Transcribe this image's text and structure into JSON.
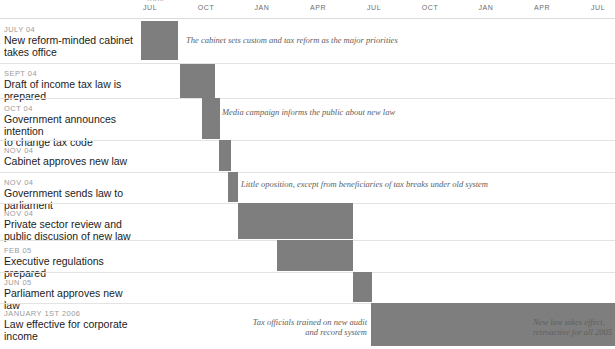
{
  "chart_data": {
    "type": "bar",
    "xlabel": "",
    "ylabel": "",
    "grid": false,
    "legend": null,
    "axis": {
      "position": "top",
      "partial_year_label": "2004",
      "ticks": [
        {
          "label": "JUL",
          "x": 150
        },
        {
          "label": "OCT",
          "x": 206
        },
        {
          "label": "JAN",
          "x": 262
        },
        {
          "label": "APR",
          "x": 318
        },
        {
          "label": "JUL",
          "x": 374
        },
        {
          "label": "OCT",
          "x": 430
        },
        {
          "label": "JAN",
          "x": 486
        },
        {
          "label": "APR",
          "x": 542
        },
        {
          "label": "JUL",
          "x": 598
        }
      ]
    },
    "bar_color": "#7e7e7e",
    "categories": [
      "New reform-minded cabinet takes office",
      "Draft of income tax law is prepared",
      "Government announces intention to change tax code",
      "Cabinet approves new law",
      "Government sends law to parliament",
      "Private sector review and public discusion of new law",
      "Executive regulations prepared",
      "Parliament approves new law",
      "Law effective for corporate income"
    ],
    "tasks": [
      {
        "date": "JULY 04",
        "event": "New reform-minded cabinet\ntakes office",
        "row_top": 18,
        "row_height": 45,
        "bar_x": 141,
        "bar_w": 37,
        "bar_y": 21,
        "bar_h": 39
      },
      {
        "date": "SEPT 04",
        "event": "Draft of income tax law is prepared",
        "row_top": 63,
        "row_height": 35,
        "bar_x": 180,
        "bar_w": 35,
        "bar_y": 64,
        "bar_h": 34
      },
      {
        "date": "OCT 04",
        "event": "Government announces intention\nto change tax code",
        "row_top": 98,
        "row_height": 42,
        "bar_x": 202,
        "bar_w": 18,
        "bar_y": 98,
        "bar_h": 41
      },
      {
        "date": "NOV 04",
        "event": "Cabinet approves new law",
        "row_top": 140,
        "row_height": 32,
        "bar_x": 219,
        "bar_w": 12,
        "bar_y": 140,
        "bar_h": 31
      },
      {
        "date": "NOV 04",
        "event": "Government sends law to parliament",
        "row_top": 172,
        "row_height": 31,
        "bar_x": 228,
        "bar_w": 10,
        "bar_y": 172,
        "bar_h": 30
      },
      {
        "date": "NOV 04",
        "event": "Private sector review and public discusion of new law",
        "row_top": 203,
        "row_height": 37,
        "bar_x": 238,
        "bar_w": 115,
        "bar_y": 203,
        "bar_h": 36
      },
      {
        "date": "FEB 05",
        "event": "Executive regulations prepared",
        "row_top": 240,
        "row_height": 32,
        "bar_x": 277,
        "bar_w": 76,
        "bar_y": 240,
        "bar_h": 31
      },
      {
        "date": "JUN 05",
        "event": "Parliament approves new law",
        "row_top": 272,
        "row_height": 31,
        "bar_x": 353,
        "bar_w": 19,
        "bar_y": 272,
        "bar_h": 30
      },
      {
        "date": "JANUARY 1ST 2006",
        "event": "Law effective for corporate income",
        "row_top": 303,
        "row_height": 43,
        "bar_x": 371,
        "bar_w": 244,
        "bar_y": 303,
        "bar_h": 43
      }
    ],
    "annotations": [
      {
        "text": "The cabinet sets custom and tax reform as the major priorities",
        "x": 186,
        "y": 35,
        "align": "left",
        "width": 300
      },
      {
        "text": "Media campaign informs the public about new law",
        "x": 222,
        "y": 107,
        "align": "left",
        "width": 250
      },
      {
        "text": "Little oposition, except from beneficiaries of tax breaks under old system",
        "x": 241,
        "y": 179,
        "align": "left",
        "width": 330
      },
      {
        "text": "Tax officials trained on new audit\nand record system",
        "x": 232,
        "y": 317,
        "align": "right",
        "width": 135
      },
      {
        "text": "New law takes effect,\nretroactive for all 2005",
        "x": 533,
        "y": 317,
        "align": "left",
        "width": 82
      }
    ]
  }
}
